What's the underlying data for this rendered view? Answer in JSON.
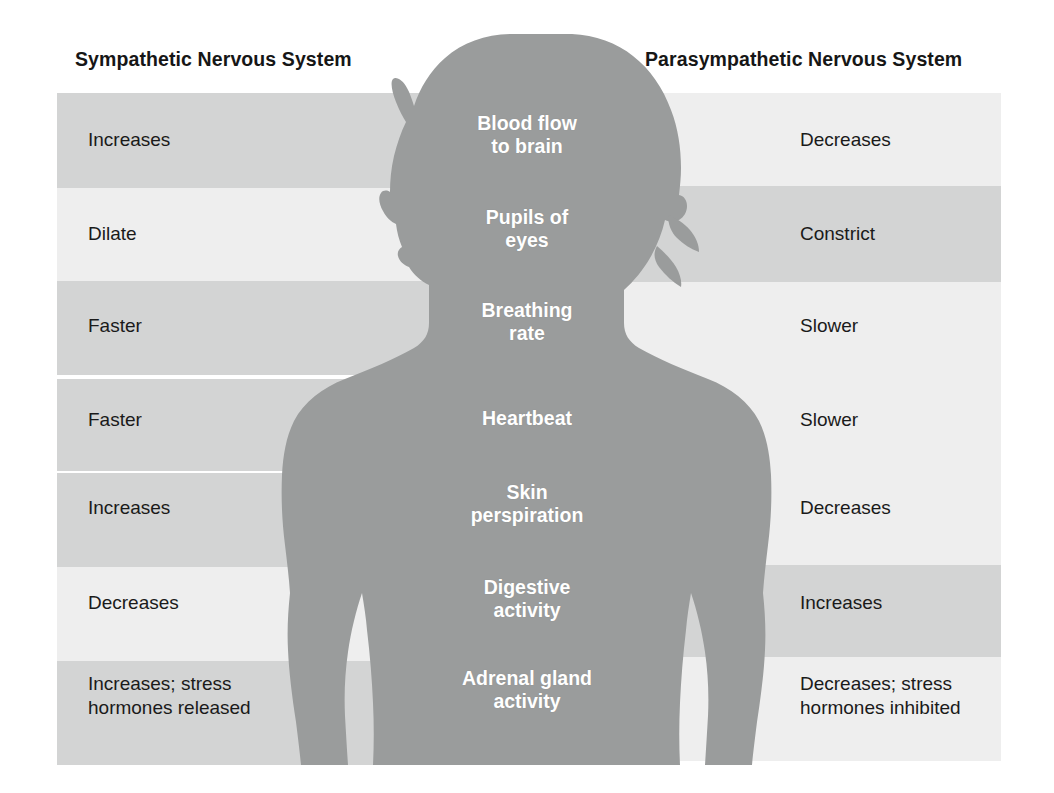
{
  "figure": {
    "title_left": "Sympathetic Nervous System",
    "title_right": "Parasympathetic Nervous System",
    "silhouette_name": "female-body-silhouette",
    "colors": {
      "band_dark": "#d3d4d4",
      "band_light": "#eeeeee",
      "silhouette": "#9a9c9c",
      "text": "#1a1a1a",
      "center_text": "#ffffff",
      "background": "#ffffff"
    }
  },
  "rows": [
    {
      "function": "Blood flow\nto brain",
      "sympathetic": "Increases",
      "parasympathetic": "Decreases",
      "left_shade": "dark",
      "right_shade": "light",
      "top": 93,
      "height": 95,
      "right_top": 93,
      "right_height": 93,
      "label_top": 128,
      "center_top": 112
    },
    {
      "function": "Pupils of\neyes",
      "sympathetic": "Dilate",
      "parasympathetic": "Constrict",
      "left_shade": "light",
      "right_shade": "dark",
      "top": 188,
      "height": 93,
      "right_top": 186,
      "right_height": 96,
      "label_top": 222,
      "center_top": 206
    },
    {
      "function": "Breathing\nrate",
      "sympathetic": "Faster",
      "parasympathetic": "Slower",
      "left_shade": "dark",
      "right_shade": "light",
      "top": 281,
      "height": 94,
      "right_top": 282,
      "right_height": 94,
      "label_top": 314,
      "center_top": 299
    },
    {
      "function": "Heartbeat",
      "sympathetic": "Faster",
      "parasympathetic": "Slower",
      "left_shade": "dark",
      "right_shade": "light",
      "top": 379,
      "height": 92,
      "right_top": 376,
      "right_height": 94,
      "label_top": 408,
      "center_top": 407
    },
    {
      "function": "Skin\nperspiration",
      "sympathetic": "Increases",
      "parasympathetic": "Decreases",
      "left_shade": "dark",
      "right_shade": "light",
      "top": 473,
      "height": 94,
      "right_top": 470,
      "right_height": 95,
      "label_top": 496,
      "center_top": 481
    },
    {
      "function": "Digestive\nactivity",
      "sympathetic": "Decreases",
      "parasympathetic": "Increases",
      "left_shade": "light",
      "right_shade": "dark",
      "top": 567,
      "height": 94,
      "right_top": 565,
      "right_height": 92,
      "label_top": 591,
      "center_top": 576
    },
    {
      "function": "Adrenal gland\nactivity",
      "sympathetic": "Increases; stress\nhormones released",
      "parasympathetic": "Decreases; stress\nhormones inhibited",
      "left_shade": "dark",
      "right_shade": "light",
      "top": 661,
      "height": 104,
      "right_top": 657,
      "right_height": 104,
      "label_top": 672,
      "center_top": 667
    }
  ]
}
